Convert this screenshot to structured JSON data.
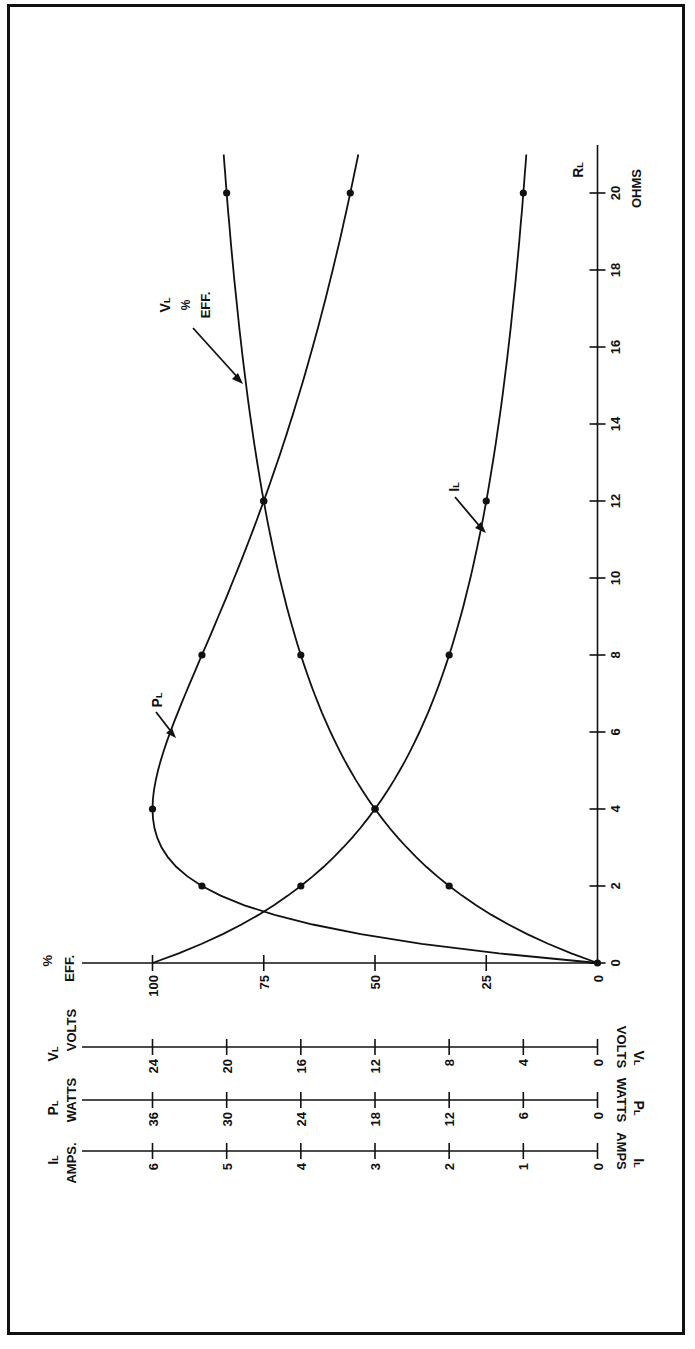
{
  "chart_data": {
    "type": "line",
    "orientation": "rotated-90-clockwise",
    "title": "",
    "xlabel": "R_L OHMS",
    "x_axis": {
      "symbol": "R",
      "subscript": "L",
      "unit": "OHMS",
      "ticks": [
        0,
        2,
        4,
        6,
        8,
        10,
        12,
        14,
        16,
        18,
        20
      ],
      "range": [
        0,
        21
      ]
    },
    "y_axes": [
      {
        "id": "eff",
        "symbol": "%",
        "unit": "EFF.",
        "ticks": [
          0,
          25,
          50,
          75,
          100
        ],
        "max": 100
      },
      {
        "id": "vl",
        "symbol": "V",
        "subscript": "L",
        "unit": "VOLTS",
        "ticks": [
          0,
          4,
          8,
          12,
          16,
          20,
          24
        ],
        "max": 24
      },
      {
        "id": "pl",
        "symbol": "P",
        "subscript": "L",
        "unit": "WATTS",
        "ticks": [
          0,
          6,
          12,
          18,
          24,
          30,
          36
        ],
        "max": 36
      },
      {
        "id": "il",
        "symbol": "I",
        "subscript": "L",
        "unit": "AMPS.",
        "ticks": [
          0,
          1,
          2,
          3,
          4,
          5,
          6
        ],
        "max": 6
      }
    ],
    "x": [
      0,
      2,
      4,
      8,
      12,
      20
    ],
    "series": [
      {
        "name": "V_L / % EFF.",
        "axis": "vl",
        "label": "VL % EFF.",
        "values": [
          0,
          8,
          12,
          16,
          18,
          20
        ],
        "eff_values": [
          0,
          33.3,
          50,
          66.7,
          75,
          83.3
        ]
      },
      {
        "name": "P_L",
        "axis": "pl",
        "label": "PL",
        "values": [
          0,
          32,
          36,
          32,
          27,
          20
        ]
      },
      {
        "name": "I_L",
        "axis": "il",
        "label": "IL",
        "values": [
          6,
          4,
          3,
          2,
          1.5,
          1
        ]
      }
    ],
    "grid": false,
    "legend": "inline arrow labels"
  },
  "labels": {
    "x_symbol": "R",
    "x_sub": "L",
    "x_unit": "OHMS",
    "eff_symbol": "%",
    "eff_unit": "EFF.",
    "vl_symbol": "V",
    "vl_sub": "L",
    "vl_unit": "VOLTS",
    "pl_symbol": "P",
    "pl_sub": "L",
    "pl_unit": "WATTS",
    "il_symbol": "I",
    "il_sub": "L",
    "il_unit": "AMPS.",
    "il_unit_right": "AMPS",
    "curve_vl_line1": "V",
    "curve_vl_sub": "L",
    "curve_vl_line2": "%",
    "curve_vl_line3": "EFF.",
    "curve_pl": "P",
    "curve_pl_sub": "L",
    "curve_il": "I",
    "curve_il_sub": "L"
  },
  "ticks": {
    "ohms": [
      "0",
      "2",
      "4",
      "6",
      "8",
      "10",
      "12",
      "14",
      "16",
      "18",
      "20"
    ],
    "eff": [
      "100",
      "75",
      "50",
      "25",
      "0"
    ],
    "volts": [
      "24",
      "20",
      "16",
      "12",
      "8",
      "4",
      "0"
    ],
    "watts": [
      "36",
      "30",
      "24",
      "18",
      "12",
      "6",
      "0"
    ],
    "amps": [
      "6",
      "5",
      "4",
      "3",
      "2",
      "1",
      "0"
    ]
  }
}
